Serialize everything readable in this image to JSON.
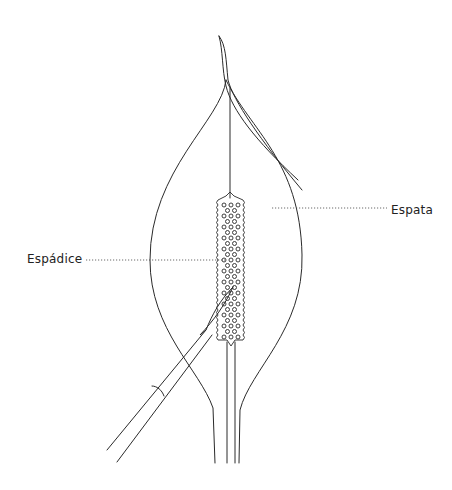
{
  "diagram": {
    "labels": {
      "spadix": "Espádice",
      "spathe": "Espata"
    },
    "colors": {
      "line": "#2a2a2a",
      "background": "#ffffff"
    }
  }
}
